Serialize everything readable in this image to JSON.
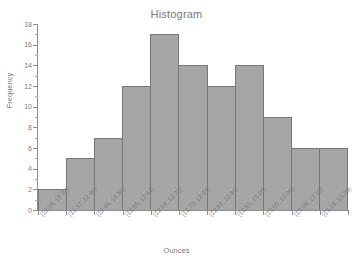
{
  "chart_data": {
    "type": "bar",
    "title": "Histogram",
    "xlabel": "Ounces",
    "ylabel": "Frequency",
    "categories": [
      "[12.28, 12.37)",
      "[12.37, 12.46)",
      "[12.46, 12.55)",
      "[12.55, 12.64)",
      "[12.64, 12.73)",
      "[12.73, 12.82)",
      "[12.82, 12.91)",
      "[12.91, 13.00)",
      "[13.00, 13.09)",
      "[13.09, 13.19)",
      "[13.19, 13.28)"
    ],
    "values": [
      2,
      5,
      7,
      12,
      17,
      14,
      12,
      14,
      9,
      6,
      6
    ],
    "ylim": [
      0,
      18
    ],
    "ytick_values": [
      0,
      2,
      4,
      6,
      8,
      10,
      12,
      14,
      16,
      18
    ],
    "ytick_labels": [
      "0",
      "2",
      "4",
      "6",
      "8",
      "10",
      "12",
      "14",
      "16",
      "18"
    ],
    "yminor_tick_step": 1,
    "grid": false,
    "legend": false,
    "bar_color": "#a6a6a6",
    "bar_border_color": "#777777",
    "axis_color": "#8c8c8c",
    "text_color": "#7a7a7a",
    "background_color": "#ffffff"
  }
}
